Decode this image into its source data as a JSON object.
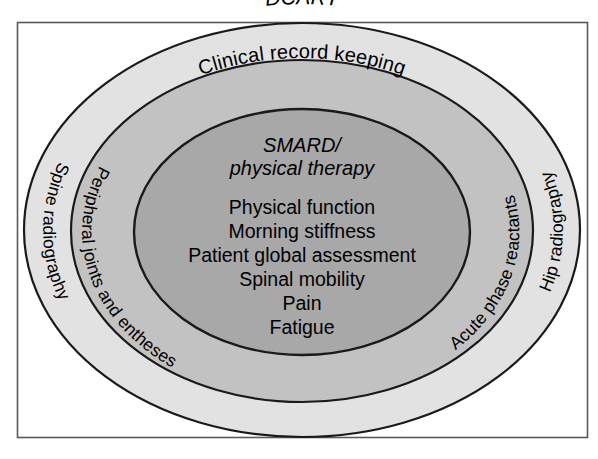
{
  "figure": {
    "title": "DCART",
    "frame": {
      "border_color": "#5a5a5a",
      "background_color": "#ffffff"
    },
    "rings": [
      {
        "id": "outer",
        "name": "DCART",
        "fill_color": "#e2e2e2",
        "stroke_color": "#1a1a1a",
        "top_label": "DCART",
        "top_label_style": "italic",
        "left_label": "Spine radiography",
        "right_label": "Hip radiography"
      },
      {
        "id": "middle",
        "name": "Clinical record keeping",
        "fill_color": "#c2c2c2",
        "stroke_color": "#1a1a1a",
        "top_label": "Clinical record keeping",
        "top_label_style": "normal",
        "left_label": "Peripheral joints and entheses",
        "right_label": "Acute phase reactants"
      },
      {
        "id": "inner",
        "name": "SMARD / physical therapy",
        "fill_color": "#a8a8a8",
        "stroke_color": "#1a1a1a",
        "heading_lines": [
          "SMARD/",
          "physical therapy"
        ],
        "heading_style": "italic",
        "items": [
          "Physical function",
          "Morning stiffness",
          "Patient global assessment",
          "Spinal mobility",
          "Pain",
          "Fatigue"
        ]
      }
    ]
  }
}
